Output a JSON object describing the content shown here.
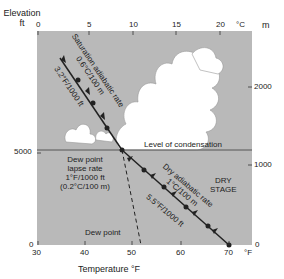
{
  "axes": {
    "left_title_line1": "Elevation",
    "left_title_line2": "ft",
    "left_ticks": [
      {
        "label": "0",
        "y": 245
      },
      {
        "label": "5000",
        "y": 153
      }
    ],
    "right_unit": "m",
    "right_ticks": [
      {
        "label": "0",
        "y": 245
      },
      {
        "label": "1000",
        "y": 165
      },
      {
        "label": "2000",
        "y": 87
      }
    ],
    "top_unit": "°C",
    "top_ticks": [
      {
        "label": "0",
        "x": 38
      },
      {
        "label": "5",
        "x": 89
      },
      {
        "label": "10",
        "x": 133
      },
      {
        "label": "15",
        "x": 176
      },
      {
        "label": "20",
        "x": 220
      }
    ],
    "bottom_unit": "°F",
    "bottom_ticks": [
      {
        "label": "30",
        "x": 38
      },
      {
        "label": "40",
        "x": 85
      },
      {
        "label": "50",
        "x": 132
      },
      {
        "label": "60",
        "x": 181
      },
      {
        "label": "70",
        "x": 229
      }
    ],
    "bottom_title": "Temperature °F"
  },
  "labels": {
    "saturation_line1": "Saturation adiabatic rate",
    "saturation_line2": "0.6°C/100 m",
    "saturation_line3": "3.2°F/1000 ft",
    "condensation": "Level of condensation",
    "dew_lapse_line1": "Dew point",
    "dew_lapse_line2": "lapse rate",
    "dew_lapse_line3": "1°F/1000 ft",
    "dew_lapse_line4": "(0.2°C/100 m)",
    "dry_line1": "Dry adiabatic rate",
    "dry_line2": "1°C/100 m",
    "dry_line3": "5.5°F/1000 ft",
    "dry_stage_line1": "DRY",
    "dry_stage_line2": "STAGE",
    "dew_point": "Dew point"
  },
  "colors": {
    "background": "#b9b9b9",
    "cloud": "#ffffff",
    "line": "#333333"
  }
}
